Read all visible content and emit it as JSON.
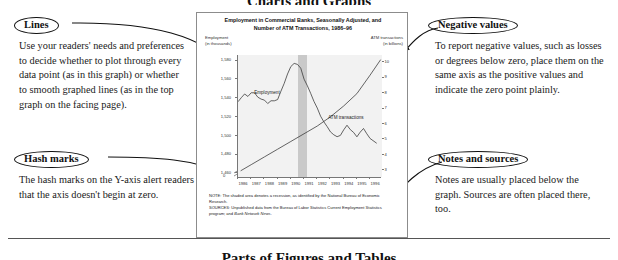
{
  "page": {
    "top_heading_partial": "Charts and Graphs",
    "footer_heading_partial": "Parts of Figures and Tables"
  },
  "callouts": [
    {
      "id": "lines",
      "title": "Lines",
      "body": "Use your readers' needs and preferences to decide whether to plot through every data point (as in this graph) or whether to smooth graphed lines (as in the top graph on the facing page)."
    },
    {
      "id": "hash-marks",
      "title": "Hash marks",
      "body": "The hash marks on the Y-axis alert readers that the axis doesn't begin at zero."
    },
    {
      "id": "negative-values",
      "title": "Negative values",
      "body": "To report negative values, such as losses or degrees below zero, place them on the same axis as the positive values and indicate the zero point plainly."
    },
    {
      "id": "notes-and-sources",
      "title": "Notes and sources",
      "body": "Notes are usually placed below the graph. Sources are often placed there, too."
    }
  ],
  "figure": {
    "title_line1": "Employment in Commercial Banks, Seasonally Adjusted, and",
    "title_line2": "Number of ATM Transactions, 1986–96",
    "left_axis_label_line1": "Employment",
    "left_axis_label_line2": "(in thousands)",
    "right_axis_label_line1": "ATM transactions",
    "right_axis_label_line2": "(in billions)",
    "zero_label": "0",
    "note": "NOTE: The shaded area denotes a recession, as identified by the National Bureau of Economic Research.",
    "sources_prefix": "SOURCES: Unpublished data from the Bureau of Labor Statistics Current Employment Statistics program; and ",
    "sources_italic": "Bank Network News",
    "sources_suffix": "."
  },
  "chart_data": {
    "type": "line",
    "title": "Employment in Commercial Banks, Seasonally Adjusted, and Number of ATM Transactions, 1986–96",
    "xlabel": "",
    "x_tick_labels": [
      "1986",
      "1987",
      "1988",
      "1989",
      "1990",
      "1991",
      "1992",
      "1993",
      "1994",
      "1995",
      "1996"
    ],
    "xlim": [
      1986,
      1996.9
    ],
    "grid": false,
    "legend_position": "inline-labels",
    "shaded_region": {
      "label": "recession",
      "x_start": 1990.55,
      "x_end": 1991.25,
      "color": "#c9c9c9"
    },
    "axes": [
      {
        "side": "left",
        "label": "Employment (in thousands)",
        "ylim": [
          1455,
          1585
        ],
        "ticks": [
          1460,
          1480,
          1500,
          1520,
          1540,
          1560,
          1580
        ],
        "tick_labels": [
          "1,460",
          "1,480",
          "1,500",
          "1,520",
          "1,540",
          "1,560",
          "1,580"
        ],
        "axis_break": true,
        "axis_break_note": "hash marks indicate axis does not begin at zero"
      },
      {
        "side": "right",
        "label": "ATM transactions (in billions)",
        "ylim": [
          2.5,
          10.4
        ],
        "ticks": [
          3,
          4,
          5,
          6,
          7,
          8,
          9,
          10
        ],
        "tick_labels": [
          "3",
          "4",
          "5",
          "6",
          "7",
          "8",
          "9",
          "10"
        ]
      }
    ],
    "series": [
      {
        "name": "Employment",
        "axis": "left",
        "units": "thousands",
        "color": "#333333",
        "x": [
          1986.0,
          1986.25,
          1986.5,
          1986.75,
          1987.0,
          1987.25,
          1987.5,
          1987.75,
          1988.0,
          1988.25,
          1988.5,
          1988.75,
          1989.0,
          1989.25,
          1989.5,
          1989.75,
          1990.0,
          1990.25,
          1990.5,
          1990.75,
          1991.0,
          1991.25,
          1991.5,
          1991.75,
          1992.0,
          1992.25,
          1992.5,
          1992.75,
          1993.0,
          1993.25,
          1993.5,
          1993.75,
          1994.0,
          1994.25,
          1994.5,
          1994.75,
          1995.0,
          1995.25,
          1995.5,
          1995.75,
          1996.0,
          1996.5
        ],
        "values": [
          1534,
          1540,
          1543,
          1542,
          1545,
          1544,
          1541,
          1538,
          1536,
          1534,
          1536,
          1535,
          1538,
          1546,
          1556,
          1565,
          1572,
          1577,
          1575,
          1570,
          1560,
          1552,
          1543,
          1536,
          1528,
          1521,
          1514,
          1508,
          1504,
          1500,
          1497,
          1500,
          1505,
          1509,
          1506,
          1502,
          1499,
          1503,
          1506,
          1502,
          1496,
          1490
        ]
      },
      {
        "name": "ATM transactions",
        "axis": "right",
        "units": "billions",
        "color": "#333333",
        "x": [
          1986.2,
          1987,
          1988,
          1989,
          1990,
          1991,
          1992,
          1993,
          1994,
          1995,
          1996,
          1996.8
        ],
        "values": [
          2.9,
          3.3,
          3.8,
          4.3,
          4.8,
          5.3,
          5.8,
          6.4,
          7.1,
          7.9,
          9.1,
          10.1
        ]
      }
    ],
    "annotations": [
      {
        "text": "Employment",
        "x": 1987.3,
        "y_axis": "left",
        "y": 1545
      },
      {
        "text": "ATM transactions",
        "x": 1992.9,
        "y_axis": "right",
        "y": 6.3
      }
    ]
  },
  "colors": {
    "panel_border": "#8c8c8c",
    "plot_background": "#f2f2f2",
    "recession_band": "#c9c9c9",
    "line": "#333333",
    "ink": "#111111"
  }
}
